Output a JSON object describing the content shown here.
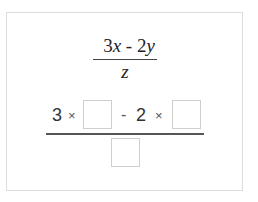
{
  "expression": {
    "numerator": {
      "coef1": "3",
      "var1": "x",
      "operator": " - ",
      "coef2": "2",
      "var2": "y"
    },
    "denominator": "z"
  },
  "substitution": {
    "coef1": "3",
    "times1": "×",
    "minus": "-",
    "coef2": "2",
    "times2": "×",
    "inputs": {
      "x_value": "",
      "y_value": "",
      "z_value": ""
    }
  }
}
